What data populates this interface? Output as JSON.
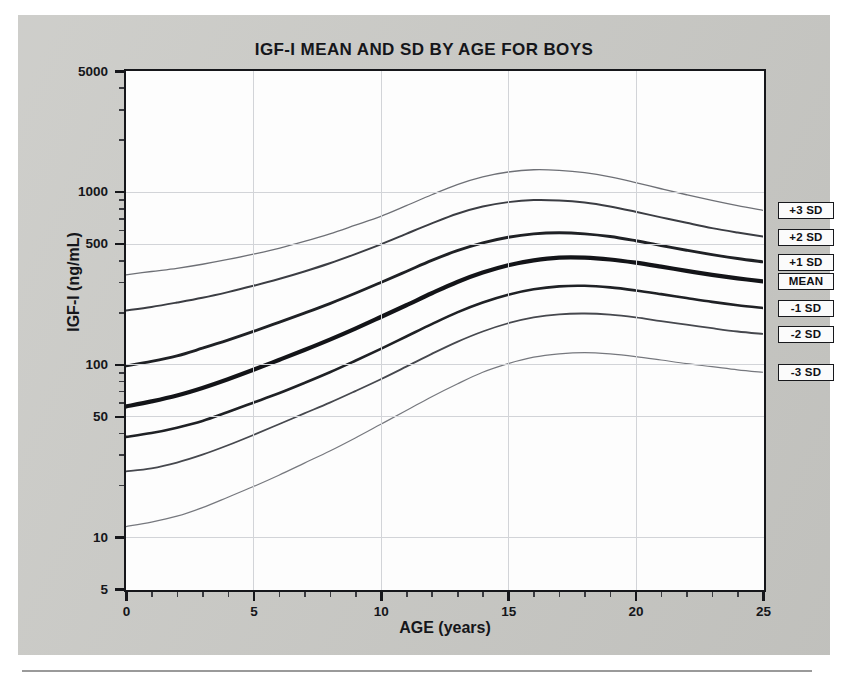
{
  "figure": {
    "title": "IGF-I MEAN AND SD BY AGE FOR BOYS",
    "x_axis_title": "AGE (years)",
    "y_axis_title": "IGF-I (ng/mL)"
  },
  "legend": {
    "items": [
      {
        "label": "+3 SD"
      },
      {
        "label": "+2 SD"
      },
      {
        "label": "+1 SD"
      },
      {
        "label": "MEAN"
      },
      {
        "label": "-1 SD"
      },
      {
        "label": "-2 SD"
      },
      {
        "label": "-3 SD"
      }
    ]
  },
  "chart_data": {
    "type": "line",
    "title": "IGF-I MEAN AND SD BY AGE FOR BOYS",
    "xlabel": "AGE (years)",
    "ylabel": "IGF-I (ng/mL)",
    "xlim": [
      0,
      25
    ],
    "ylim": [
      5,
      5000
    ],
    "yscale": "log",
    "xscale": "linear",
    "grid": true,
    "legend_position": "right-outside",
    "x_ticks": [
      0,
      5,
      10,
      15,
      20,
      25
    ],
    "y_ticks": [
      5,
      10,
      50,
      100,
      500,
      1000,
      5000
    ],
    "y_tick_labels": [
      "5",
      "10",
      "50",
      "100",
      "500",
      "1000",
      "5000"
    ],
    "x": [
      0,
      1,
      2,
      3,
      4,
      5,
      6,
      7,
      8,
      9,
      10,
      11,
      12,
      13,
      14,
      15,
      16,
      17,
      18,
      19,
      20,
      21,
      22,
      23,
      24,
      25
    ],
    "series": [
      {
        "name": "+3 SD",
        "values": [
          330,
          345,
          360,
          380,
          405,
          435,
          470,
          515,
          570,
          640,
          720,
          830,
          960,
          1100,
          1220,
          1300,
          1340,
          1330,
          1290,
          1220,
          1130,
          1040,
          960,
          890,
          830,
          780
        ]
      },
      {
        "name": "+2 SD",
        "values": [
          205,
          215,
          228,
          243,
          262,
          285,
          312,
          345,
          385,
          435,
          495,
          570,
          655,
          745,
          820,
          870,
          895,
          890,
          865,
          820,
          765,
          710,
          660,
          615,
          580,
          550
        ]
      },
      {
        "name": "+1 SD",
        "values": [
          98,
          104,
          112,
          124,
          138,
          155,
          175,
          198,
          225,
          258,
          298,
          345,
          400,
          455,
          505,
          545,
          570,
          578,
          570,
          550,
          520,
          488,
          458,
          432,
          410,
          392
        ]
      },
      {
        "name": "MEAN",
        "values": [
          57,
          61,
          66,
          73,
          82,
          93,
          106,
          121,
          139,
          161,
          188,
          220,
          258,
          300,
          340,
          375,
          400,
          415,
          415,
          405,
          388,
          368,
          348,
          330,
          315,
          302
        ]
      },
      {
        "name": "-1 SD",
        "values": [
          38,
          40,
          43,
          47,
          53,
          60,
          68,
          78,
          90,
          105,
          123,
          145,
          171,
          200,
          228,
          253,
          272,
          283,
          285,
          279,
          268,
          255,
          242,
          230,
          220,
          212
        ]
      },
      {
        "name": "-2 SD",
        "values": [
          24,
          25,
          27,
          30,
          34,
          39,
          45,
          52,
          60,
          70,
          82,
          97,
          115,
          135,
          155,
          173,
          187,
          195,
          197,
          194,
          187,
          178,
          170,
          162,
          155,
          150
        ]
      },
      {
        "name": "-3 SD",
        "values": [
          11.5,
          12.2,
          13.2,
          14.8,
          17,
          19.6,
          22.8,
          26.8,
          31.5,
          37.5,
          45,
          54,
          65,
          77,
          90,
          101,
          110,
          115,
          117,
          115,
          111,
          106,
          101,
          97,
          93,
          90
        ]
      }
    ]
  },
  "style": {
    "panel_color": "#c9c9c5",
    "plot_bg": "#fdfdfd",
    "frame_color": "#16171b",
    "grid_color": "#d2d4d8",
    "curve_color": "#1a1b1f"
  }
}
